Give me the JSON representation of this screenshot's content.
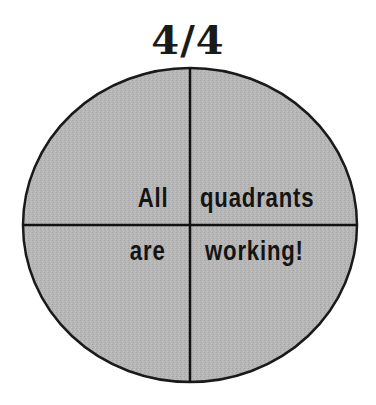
{
  "title": "4/4",
  "quadrants": {
    "top_left": "All",
    "top_right": "quadrants",
    "bottom_left": "are",
    "bottom_right": "working!"
  },
  "colors": {
    "fill": "#b4b4b4",
    "stroke": "#1a1a1a",
    "background": "#ffffff"
  }
}
